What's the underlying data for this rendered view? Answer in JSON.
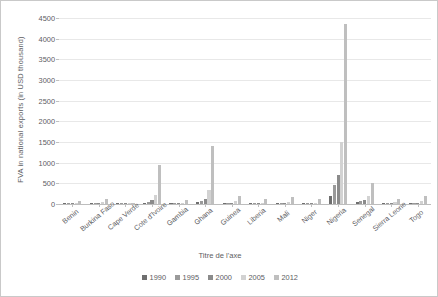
{
  "chart_data": {
    "type": "bar",
    "title": "",
    "xlabel": "Titre de l'axe",
    "ylabel": "FVA in  national exports  (in USD thousand)",
    "ylim": [
      0,
      4500
    ],
    "yticks": [
      0,
      500,
      1000,
      1500,
      2000,
      2500,
      3000,
      3500,
      4000,
      4500
    ],
    "grid": true,
    "legend_position": "bottom",
    "categories": [
      "Benin",
      "Burkina Faso",
      "Cape Verde",
      "Cote d'Ivoire",
      "Gambia",
      "Ghana",
      "Guinea",
      "Liberia",
      "Mali",
      "Niger",
      "Nigeria",
      "Senegal",
      "Sierra Leone",
      "Togo"
    ],
    "series": [
      {
        "name": "1990",
        "color": "#6f6f6f",
        "values": [
          10,
          12,
          4,
          30,
          6,
          40,
          20,
          8,
          14,
          10,
          200,
          45,
          10,
          18
        ]
      },
      {
        "name": "1995",
        "color": "#9a9a9a",
        "values": [
          14,
          18,
          6,
          55,
          10,
          70,
          28,
          12,
          20,
          14,
          450,
          70,
          16,
          26
        ]
      },
      {
        "name": "2000",
        "color": "#8b8b8b",
        "values": [
          18,
          22,
          8,
          90,
          14,
          110,
          36,
          16,
          26,
          18,
          700,
          95,
          22,
          34
        ]
      },
      {
        "name": "2005",
        "color": "#d2d2d2",
        "values": [
          30,
          40,
          14,
          230,
          30,
          330,
          70,
          34,
          55,
          36,
          1500,
          185,
          45,
          70
        ]
      },
      {
        "name": "2012",
        "color": "#bfbfbf",
        "values": [
          75,
          110,
          30,
          950,
          95,
          1400,
          185,
          120,
          175,
          110,
          4350,
          500,
          130,
          185
        ]
      }
    ]
  },
  "legend": {
    "items": [
      {
        "label": "1990",
        "color": "#6f6f6f"
      },
      {
        "label": "1995",
        "color": "#9a9a9a"
      },
      {
        "label": "2000",
        "color": "#8b8b8b"
      },
      {
        "label": "2005",
        "color": "#d2d2d2"
      },
      {
        "label": "2012",
        "color": "#bfbfbf"
      }
    ]
  }
}
